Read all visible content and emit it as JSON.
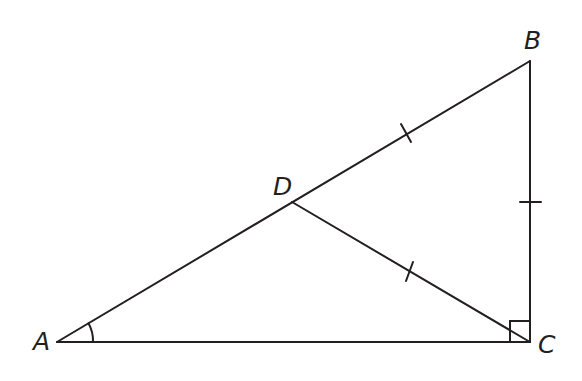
{
  "diagram": {
    "type": "geometry",
    "stroke_color": "#231f20",
    "background": "#ffffff",
    "points": {
      "A": {
        "label": "A",
        "x": 57,
        "y": 342
      },
      "B": {
        "label": "B",
        "x": 530,
        "y": 61
      },
      "C": {
        "label": "C",
        "x": 530,
        "y": 342
      },
      "D": {
        "label": "D",
        "x": 292,
        "y": 202
      }
    },
    "segments": [
      {
        "from": "A",
        "to": "B"
      },
      {
        "from": "B",
        "to": "C"
      },
      {
        "from": "A",
        "to": "C"
      },
      {
        "from": "D",
        "to": "C"
      }
    ],
    "tick_marks": [
      {
        "segment": "DB",
        "count": 1
      },
      {
        "segment": "BC",
        "count": 1
      },
      {
        "segment": "DC",
        "count": 1
      }
    ],
    "angle_marks": [
      {
        "vertex": "A",
        "type": "arc"
      },
      {
        "vertex": "C",
        "type": "right-angle"
      }
    ]
  }
}
